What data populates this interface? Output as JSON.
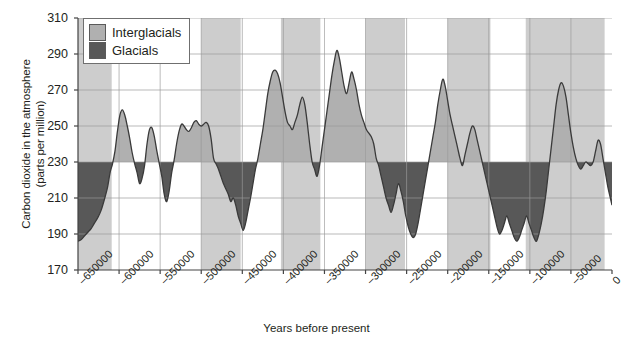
{
  "chart_data": {
    "type": "area",
    "title": "",
    "xlabel": "Years before present",
    "ylabel": "Carbon dioxide in the atmosphere\n(parts per million)",
    "xlim": [
      -650000,
      0
    ],
    "ylim": [
      170,
      310
    ],
    "yticks": [
      170,
      190,
      210,
      230,
      250,
      270,
      290,
      310
    ],
    "xticks": [
      -650000,
      -600000,
      -550000,
      -500000,
      -450000,
      -400000,
      -350000,
      -300000,
      -250000,
      -200000,
      -150000,
      -100000,
      -50000,
      0
    ],
    "xticklabels": [
      "–650000",
      "–600000",
      "–550000",
      "–500000",
      "–450000",
      "–400000",
      "–350000",
      "–300000",
      "–250000",
      "–200000",
      "–150000",
      "–100000",
      "–50000",
      "0"
    ],
    "grid": true,
    "threshold": 230,
    "series_name": "Atmospheric CO2",
    "colors": {
      "interglacial_fill": "#b0b0b0",
      "glacial_fill": "#585858",
      "band_shade": "#cdcdcd",
      "gridline": "#9a9a9a",
      "axis": "#444444",
      "line": "#3a3a3a",
      "background": "#ffffff"
    },
    "shaded_bands": [
      {
        "start": -650000,
        "end": -609000
      },
      {
        "start": -500000,
        "end": -452000
      },
      {
        "start": -403000,
        "end": -355000
      },
      {
        "start": -300000,
        "end": -252000
      },
      {
        "start": -200000,
        "end": -148000
      },
      {
        "start": -105000,
        "end": -9000
      }
    ],
    "x": [
      -650000,
      -646000,
      -642000,
      -638000,
      -634000,
      -630000,
      -626000,
      -622000,
      -618000,
      -614000,
      -611000,
      -608000,
      -605000,
      -602000,
      -599000,
      -596000,
      -593000,
      -590000,
      -587000,
      -584000,
      -581000,
      -578000,
      -575000,
      -572000,
      -569000,
      -566000,
      -563000,
      -560000,
      -557000,
      -554000,
      -551000,
      -548000,
      -545000,
      -542000,
      -539000,
      -536000,
      -533000,
      -530000,
      -527000,
      -524000,
      -521000,
      -518000,
      -515000,
      -512000,
      -509000,
      -506000,
      -503000,
      -500000,
      -497000,
      -494000,
      -491000,
      -488000,
      -485000,
      -482000,
      -479000,
      -476000,
      -473000,
      -470000,
      -467000,
      -464000,
      -461000,
      -458000,
      -455000,
      -452000,
      -449000,
      -446000,
      -443000,
      -440000,
      -437000,
      -434000,
      -431000,
      -428000,
      -425000,
      -422000,
      -419000,
      -416000,
      -413000,
      -410000,
      -407000,
      -404000,
      -401000,
      -398000,
      -395000,
      -392000,
      -389000,
      -386000,
      -383000,
      -380000,
      -377000,
      -374000,
      -371000,
      -368000,
      -365000,
      -362000,
      -359000,
      -356000,
      -353000,
      -350000,
      -347000,
      -344000,
      -341000,
      -338000,
      -335000,
      -332000,
      -329000,
      -326000,
      -323000,
      -320000,
      -317000,
      -314000,
      -311000,
      -308000,
      -305000,
      -302000,
      -299000,
      -296000,
      -293000,
      -290000,
      -287000,
      -284000,
      -281000,
      -278000,
      -275000,
      -272000,
      -269000,
      -266000,
      -263000,
      -260000,
      -257000,
      -254000,
      -251000,
      -248000,
      -245000,
      -242000,
      -239000,
      -236000,
      -233000,
      -230000,
      -227000,
      -224000,
      -221000,
      -218000,
      -215000,
      -212000,
      -209000,
      -206000,
      -203000,
      -200000,
      -197000,
      -194000,
      -191000,
      -188000,
      -185000,
      -182000,
      -179000,
      -176000,
      -173000,
      -170000,
      -167000,
      -164000,
      -161000,
      -158000,
      -155000,
      -152000,
      -149000,
      -146000,
      -143000,
      -140000,
      -137000,
      -134000,
      -131000,
      -128000,
      -125000,
      -122000,
      -119000,
      -116000,
      -113000,
      -110000,
      -107000,
      -104000,
      -101000,
      -98000,
      -95000,
      -92000,
      -89000,
      -86000,
      -83000,
      -80000,
      -77000,
      -74000,
      -71000,
      -68000,
      -65000,
      -62000,
      -59000,
      -56000,
      -53000,
      -50000,
      -47000,
      -44000,
      -41000,
      -38000,
      -35000,
      -32000,
      -29000,
      -26000,
      -23000,
      -20000,
      -17000,
      -14000,
      -11000,
      -8000,
      -5000,
      -2000,
      0
    ],
    "y": [
      186,
      187,
      189,
      191,
      193,
      196,
      199,
      203,
      209,
      216,
      224,
      229,
      236,
      247,
      256,
      259,
      256,
      250,
      243,
      235,
      229,
      224,
      218,
      221,
      228,
      240,
      248,
      249,
      244,
      236,
      229,
      222,
      212,
      208,
      214,
      224,
      231,
      240,
      247,
      251,
      250,
      248,
      247,
      249,
      252,
      253,
      251,
      250,
      251,
      252,
      250,
      243,
      232,
      229,
      226,
      222,
      218,
      215,
      212,
      208,
      210,
      206,
      200,
      196,
      192,
      196,
      203,
      210,
      218,
      226,
      232,
      240,
      248,
      258,
      268,
      275,
      280,
      281,
      279,
      274,
      266,
      258,
      252,
      250,
      248,
      252,
      256,
      262,
      266,
      262,
      252,
      240,
      230,
      226,
      222,
      228,
      238,
      248,
      258,
      268,
      278,
      286,
      292,
      288,
      280,
      272,
      268,
      274,
      280,
      276,
      270,
      262,
      256,
      252,
      248,
      246,
      244,
      240,
      232,
      228,
      222,
      216,
      210,
      206,
      202,
      206,
      212,
      218,
      214,
      208,
      200,
      194,
      190,
      188,
      190,
      196,
      204,
      212,
      220,
      228,
      236,
      244,
      252,
      262,
      270,
      276,
      272,
      264,
      256,
      250,
      244,
      238,
      232,
      228,
      234,
      240,
      246,
      250,
      248,
      242,
      236,
      230,
      224,
      218,
      212,
      206,
      200,
      194,
      190,
      192,
      196,
      200,
      196,
      192,
      188,
      186,
      188,
      192,
      196,
      200,
      196,
      192,
      188,
      186,
      190,
      196,
      204,
      214,
      226,
      238,
      250,
      262,
      270,
      274,
      272,
      266,
      256,
      246,
      238,
      232,
      228,
      226,
      228,
      230,
      229,
      228,
      230,
      236,
      242,
      240,
      232,
      224,
      216,
      210,
      206,
      202,
      198,
      194,
      192,
      196,
      202,
      208,
      212,
      210,
      206,
      200,
      194,
      190,
      188,
      186,
      190,
      196,
      202,
      206,
      204,
      200,
      196,
      192,
      190,
      188,
      186,
      184,
      186,
      190,
      196,
      204,
      212,
      220,
      228,
      240,
      252,
      262,
      258,
      252,
      258,
      266,
      276,
      286,
      296,
      308
    ]
  },
  "legend": {
    "position": "top-left",
    "items": [
      {
        "label": "Interglacials",
        "color": "#b0b0b0",
        "name": "interglacials"
      },
      {
        "label": "Glacials",
        "color": "#585858",
        "name": "glacials"
      }
    ]
  }
}
